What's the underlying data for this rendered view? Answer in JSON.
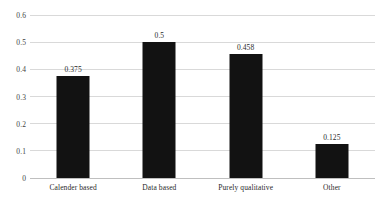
{
  "chart_data": {
    "type": "bar",
    "title": "",
    "subtitle": "",
    "xlabel": "",
    "ylabel": "",
    "categories": [
      "Calender based",
      "Data based",
      "Purely qualitative",
      "Other"
    ],
    "values": [
      0.375,
      0.5,
      0.458,
      0.125
    ],
    "value_labels": [
      "0.375",
      "0.5",
      "0.458",
      "0.125"
    ],
    "ylim": [
      0,
      0.6
    ],
    "yticks": [
      0,
      0.1,
      0.2,
      0.3,
      0.4,
      0.5,
      0.6
    ],
    "ytick_labels": [
      "0",
      "0.1",
      "0.2",
      "0.3",
      "0.4",
      "0.5",
      "0.6"
    ],
    "grid": true,
    "legend": false,
    "legend_position": "none",
    "annotations": [],
    "colors": {
      "bar": "#121212",
      "gridline": "#d9d9d9",
      "baseline": "#bfbfbf",
      "text": "#2a2a2a",
      "background": "#ffffff"
    }
  }
}
